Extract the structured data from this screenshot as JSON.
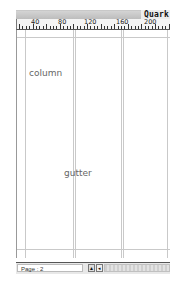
{
  "window": {
    "title": "Quark"
  },
  "ruler": {
    "labels": [
      {
        "text": "40",
        "x": 28
      },
      {
        "text": "80",
        "x": 55
      },
      {
        "text": "120",
        "x": 81
      },
      {
        "text": "160",
        "x": 113
      },
      {
        "text": "200",
        "x": 141
      }
    ]
  },
  "page": {
    "column_label": "column",
    "gutter_label": "gutter"
  },
  "statusbar": {
    "page_field": "Page : 2",
    "page_menu_icon": "popup-arrow-icon",
    "page_prev_icon": "page-nav-icon"
  }
}
